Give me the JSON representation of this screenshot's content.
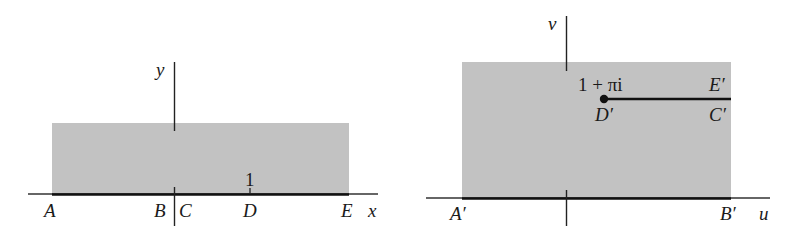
{
  "colors": {
    "region": "#c2c2c2",
    "axis": "#222222",
    "boundary": "#111111"
  },
  "left_panel": {
    "axis_labels": {
      "x": "x",
      "y": "y"
    },
    "tick_label_1": "1",
    "points": {
      "A": "A",
      "B": "B",
      "C": "C",
      "D": "D",
      "E": "E"
    }
  },
  "right_panel": {
    "axis_labels": {
      "u": "u",
      "v": "v"
    },
    "point_value": "1 + πi",
    "points": {
      "A": "A′",
      "B": "B′",
      "C": "C′",
      "D": "D′",
      "E": "E′"
    }
  }
}
